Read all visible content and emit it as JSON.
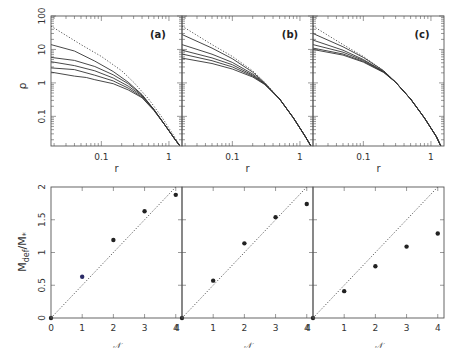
{
  "header": {
    "left_text": "",
    "right_text": ""
  },
  "colors": {
    "axis": "#555555",
    "curve": "#333333",
    "dotted": "#444444",
    "point": "#222222",
    "point_blue": "#2a2a66"
  },
  "chart_data": [
    {
      "type": "line",
      "panel": "(a)",
      "xscale": "log",
      "yscale": "log",
      "xlabel": "r",
      "ylabel": "ρ",
      "xlim": [
        0.018,
        1.56
      ],
      "ylim": [
        0.013,
        100
      ],
      "xticks": [
        "0.1",
        "1"
      ],
      "yticks": [
        "0.1",
        "1",
        "10",
        "100"
      ],
      "series": [
        {
          "name": "dotted reference",
          "style": "dotted",
          "x": [
            0.018,
            0.05,
            0.1,
            0.2,
            0.3,
            0.5,
            0.8,
            1.2,
            1.45
          ],
          "y": [
            50,
            14,
            6.2,
            2.3,
            1.05,
            0.33,
            0.09,
            0.025,
            0.013
          ]
        },
        {
          "name": "curve 1",
          "x": [
            0.018,
            0.04,
            0.08,
            0.15,
            0.25,
            0.4,
            0.6,
            0.9,
            1.2,
            1.45
          ],
          "y": [
            14,
            9.0,
            4.5,
            2.2,
            1.05,
            0.45,
            0.16,
            0.05,
            0.022,
            0.013
          ]
        },
        {
          "name": "curve 2",
          "x": [
            0.018,
            0.04,
            0.08,
            0.15,
            0.25,
            0.4,
            0.6,
            0.9,
            1.2,
            1.45
          ],
          "y": [
            5.8,
            4.7,
            3.1,
            1.75,
            0.95,
            0.43,
            0.16,
            0.05,
            0.022,
            0.013
          ]
        },
        {
          "name": "curve 3",
          "x": [
            0.018,
            0.04,
            0.08,
            0.15,
            0.25,
            0.4,
            0.6,
            0.9,
            1.2,
            1.45
          ],
          "y": [
            4.3,
            3.3,
            2.3,
            1.4,
            0.8,
            0.41,
            0.16,
            0.05,
            0.022,
            0.013
          ]
        },
        {
          "name": "curve 4",
          "x": [
            0.018,
            0.04,
            0.08,
            0.15,
            0.25,
            0.4,
            0.6,
            0.9,
            1.2,
            1.45
          ],
          "y": [
            2.8,
            2.5,
            1.7,
            1.15,
            0.7,
            0.38,
            0.155,
            0.05,
            0.022,
            0.013
          ]
        },
        {
          "name": "curve 5",
          "x": [
            0.018,
            0.04,
            0.06,
            0.08,
            0.15,
            0.25,
            0.4,
            0.6,
            0.9,
            1.2,
            1.45
          ],
          "y": [
            2.1,
            1.6,
            1.45,
            1.25,
            0.95,
            0.62,
            0.36,
            0.15,
            0.05,
            0.022,
            0.013
          ]
        }
      ]
    },
    {
      "type": "line",
      "panel": "(b)",
      "xscale": "log",
      "yscale": "log",
      "xlabel": "r",
      "ylabel": "",
      "xlim": [
        0.018,
        1.56
      ],
      "ylim": [
        0.013,
        100
      ],
      "xticks": [
        "0.1",
        "1"
      ],
      "yticks": [],
      "series": [
        {
          "name": "dotted reference",
          "style": "dotted",
          "x": [
            0.018,
            0.05,
            0.1,
            0.2,
            0.3,
            0.5,
            0.8,
            1.2,
            1.45
          ],
          "y": [
            50,
            14,
            6.2,
            2.3,
            1.05,
            0.33,
            0.09,
            0.025,
            0.013
          ]
        },
        {
          "name": "curve 1",
          "x": [
            0.018,
            0.05,
            0.1,
            0.2,
            0.3,
            0.5,
            0.8,
            1.2,
            1.45
          ],
          "y": [
            28,
            11,
            5.3,
            2.1,
            1.0,
            0.33,
            0.09,
            0.025,
            0.013
          ]
        },
        {
          "name": "curve 2",
          "x": [
            0.018,
            0.05,
            0.1,
            0.2,
            0.3,
            0.5,
            0.8,
            1.2,
            1.45
          ],
          "y": [
            14,
            7.2,
            4.1,
            1.85,
            0.98,
            0.33,
            0.09,
            0.025,
            0.013
          ]
        },
        {
          "name": "curve 3",
          "x": [
            0.018,
            0.05,
            0.1,
            0.2,
            0.3,
            0.5,
            0.8,
            1.2,
            1.45
          ],
          "y": [
            9.5,
            5.6,
            3.5,
            1.7,
            0.95,
            0.33,
            0.09,
            0.025,
            0.013
          ]
        },
        {
          "name": "curve 4",
          "x": [
            0.018,
            0.05,
            0.1,
            0.2,
            0.3,
            0.5,
            0.8,
            1.2,
            1.45
          ],
          "y": [
            7.3,
            4.6,
            3.0,
            1.6,
            0.93,
            0.33,
            0.09,
            0.025,
            0.013
          ]
        },
        {
          "name": "curve 5",
          "x": [
            0.018,
            0.05,
            0.1,
            0.2,
            0.3,
            0.5,
            0.8,
            1.2,
            1.45
          ],
          "y": [
            5.5,
            3.8,
            2.6,
            1.5,
            0.9,
            0.33,
            0.09,
            0.025,
            0.013
          ]
        }
      ]
    },
    {
      "type": "line",
      "panel": "(c)",
      "xscale": "log",
      "yscale": "log",
      "xlabel": "r",
      "ylabel": "",
      "xlim": [
        0.018,
        1.56
      ],
      "ylim": [
        0.013,
        100
      ],
      "xticks": [
        "0.1",
        "1"
      ],
      "yticks": [],
      "series": [
        {
          "name": "dotted reference",
          "style": "dotted",
          "x": [
            0.018,
            0.05,
            0.1,
            0.2,
            0.3,
            0.5,
            0.8,
            1.2,
            1.4
          ],
          "y": [
            50,
            14,
            6.2,
            2.3,
            1.05,
            0.33,
            0.09,
            0.025,
            0.013
          ]
        },
        {
          "name": "curve 1",
          "x": [
            0.018,
            0.05,
            0.1,
            0.2,
            0.3,
            0.5,
            0.8,
            1.2,
            1.4
          ],
          "y": [
            30,
            12,
            5.8,
            2.3,
            1.05,
            0.33,
            0.09,
            0.025,
            0.013
          ]
        },
        {
          "name": "curve 2",
          "x": [
            0.018,
            0.05,
            0.1,
            0.2,
            0.3,
            0.5,
            0.8,
            1.2,
            1.4
          ],
          "y": [
            19,
            9.5,
            5.0,
            2.2,
            1.05,
            0.33,
            0.09,
            0.025,
            0.013
          ]
        },
        {
          "name": "curve 3",
          "x": [
            0.018,
            0.05,
            0.1,
            0.2,
            0.3,
            0.5,
            0.8,
            1.2,
            1.4
          ],
          "y": [
            14,
            8.3,
            4.7,
            2.15,
            1.05,
            0.33,
            0.09,
            0.025,
            0.013
          ]
        },
        {
          "name": "curve 4",
          "x": [
            0.018,
            0.05,
            0.1,
            0.2,
            0.3,
            0.5,
            0.8,
            1.2,
            1.4
          ],
          "y": [
            11,
            7.3,
            4.4,
            2.1,
            1.05,
            0.33,
            0.09,
            0.025,
            0.013
          ]
        },
        {
          "name": "curve 5",
          "x": [
            0.018,
            0.05,
            0.1,
            0.2,
            0.3,
            0.5,
            0.8,
            1.2,
            1.4
          ],
          "y": [
            10,
            6.8,
            4.2,
            2.05,
            1.05,
            0.33,
            0.09,
            0.025,
            0.013
          ]
        }
      ]
    },
    {
      "type": "scatter",
      "panel": "bottom-left",
      "xlabel": "𝒩",
      "ylabel": "M_def/M_*",
      "xlim": [
        0,
        4.2
      ],
      "ylim": [
        0,
        2
      ],
      "xticks": [
        "0",
        "1",
        "2",
        "3",
        "4"
      ],
      "yticks": [
        "0",
        "0.5",
        "1",
        "1.5",
        "2"
      ],
      "x": [
        0,
        1,
        2,
        3,
        4
      ],
      "y": [
        0,
        0.63,
        1.19,
        1.63,
        1.88
      ],
      "reference_line": {
        "style": "dotted",
        "x": [
          0,
          4.2
        ],
        "y": [
          0,
          2.1
        ]
      }
    },
    {
      "type": "scatter",
      "panel": "bottom-middle",
      "xlabel": "𝒩",
      "ylabel": "",
      "xlim": [
        0,
        4.2
      ],
      "ylim": [
        0,
        2
      ],
      "xticks": [
        "1",
        "2",
        "3",
        "4"
      ],
      "yticks": [],
      "x": [
        0,
        1,
        2,
        3,
        4
      ],
      "y": [
        0,
        0.57,
        1.14,
        1.54,
        1.74
      ],
      "reference_line": {
        "style": "dotted",
        "x": [
          0,
          4.2
        ],
        "y": [
          0,
          2.1
        ]
      }
    },
    {
      "type": "scatter",
      "panel": "bottom-right",
      "xlabel": "𝒩",
      "ylabel": "",
      "xlim": [
        0,
        4.2
      ],
      "ylim": [
        0,
        2
      ],
      "xticks": [
        "1",
        "2",
        "3",
        "4"
      ],
      "yticks": [],
      "x": [
        0,
        1,
        2,
        3,
        4
      ],
      "y": [
        0,
        0.41,
        0.79,
        1.09,
        1.29
      ],
      "reference_line": {
        "style": "dotted",
        "x": [
          0,
          4.2
        ],
        "y": [
          0,
          2.1
        ]
      }
    }
  ]
}
